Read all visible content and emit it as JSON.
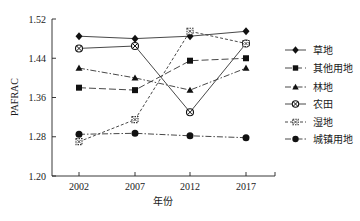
{
  "chart_data": {
    "type": "line",
    "title": "",
    "xlabel": "年份",
    "ylabel": "PAFRAC",
    "x": [
      "2002",
      "2007",
      "2012",
      "2017"
    ],
    "yticks": [
      "1.20",
      "1.28",
      "1.36",
      "1.44",
      "1.52"
    ],
    "ylim": [
      1.2,
      1.52
    ],
    "grid": false,
    "legend_position": "right",
    "series": [
      {
        "name": "草地",
        "marker": "diamond",
        "line": "solid",
        "values": [
          1.485,
          1.48,
          1.485,
          1.495
        ]
      },
      {
        "name": "其他用地",
        "marker": "square",
        "line": "long-dash",
        "values": [
          1.38,
          1.375,
          1.435,
          1.44
        ]
      },
      {
        "name": "林地",
        "marker": "triangle",
        "line": "dash-dot",
        "values": [
          1.42,
          1.4,
          1.375,
          1.42
        ]
      },
      {
        "name": "农田",
        "marker": "circle-x",
        "line": "solid",
        "values": [
          1.46,
          1.465,
          1.33,
          1.47
        ]
      },
      {
        "name": "湿地",
        "marker": "square-x",
        "line": "short-dash",
        "values": [
          1.27,
          1.315,
          1.495,
          1.47
        ]
      },
      {
        "name": "城镇用地",
        "marker": "circle",
        "line": "dash-dot",
        "values": [
          1.285,
          1.287,
          1.282,
          1.278
        ]
      }
    ]
  }
}
